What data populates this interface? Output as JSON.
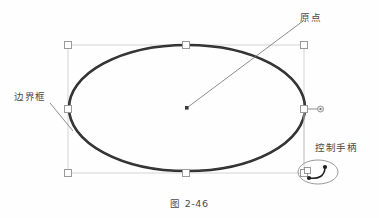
{
  "figure": {
    "caption": "图 2-46",
    "background_color": "#fefefe",
    "annotations": {
      "origin": {
        "label": "原点",
        "icon": "origin-dot-icon",
        "leader_from": [
          188,
          108
        ],
        "leader_to": [
          303,
          21
        ]
      },
      "bounding_box": {
        "label": "边界框",
        "icon": "bounding-box-icon",
        "leader_from": [
          50,
          104
        ],
        "leader_to": [
          72,
          130
        ]
      },
      "control_handle": {
        "label": "控制手柄",
        "icon": "rotate-handle-icon"
      }
    },
    "shape": {
      "type": "ellipse",
      "name": "ellipse-shape",
      "center": [
        187,
        108
      ],
      "radius_x": 118,
      "radius_y": 63,
      "stroke_color": "#2b2b2b",
      "stroke_width": 2.6
    },
    "selection": {
      "box_color": "#d0d0d0",
      "handle_fill": "#ffffff",
      "handle_stroke": "#a8a8a8",
      "bounds": {
        "x": 68,
        "y": 45,
        "width": 236,
        "height": 128
      },
      "handles": [
        {
          "name": "handle-top-left",
          "x": 68,
          "y": 45
        },
        {
          "name": "handle-top-center",
          "x": 186,
          "y": 45
        },
        {
          "name": "handle-top-right",
          "x": 304,
          "y": 45
        },
        {
          "name": "handle-middle-left",
          "x": 68,
          "y": 109
        },
        {
          "name": "handle-middle-right",
          "x": 304,
          "y": 109
        },
        {
          "name": "handle-bottom-left",
          "x": 68,
          "y": 173
        },
        {
          "name": "handle-bottom-center",
          "x": 186,
          "y": 173
        },
        {
          "name": "handle-bottom-right",
          "x": 304,
          "y": 173
        }
      ],
      "connector_dot": {
        "name": "connector-dot",
        "x": 320,
        "y": 109
      }
    },
    "rotate_widget": {
      "name": "rotate-handle-widget",
      "center": [
        318,
        172
      ],
      "radius_x": 20,
      "radius_y": 12,
      "handle": {
        "x": 308,
        "y": 171
      }
    }
  }
}
